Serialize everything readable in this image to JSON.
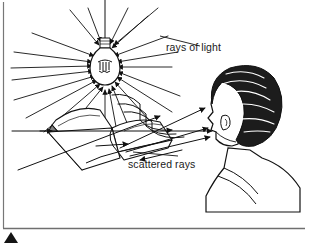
{
  "figure": {
    "kind": "optics-diagram",
    "background_color": "#ffffff",
    "ink_color": "#111111",
    "frame": {
      "left_rule": true,
      "bottom_rule": true,
      "rule_color": "#6f6f6f"
    },
    "page_marker": {
      "name": "corner-triangle-marker",
      "shape": "triangle",
      "color": "#111111"
    }
  },
  "labels": {
    "rays_of_light": "rays of light",
    "scattered_rays": "scattered rays"
  },
  "objects": {
    "lamp": {
      "name": "light-bulb",
      "description": "hanging incandescent bulb with filament and screw base"
    },
    "book": {
      "name": "open-book",
      "description": "open book lying on a surface, drawn in perspective"
    },
    "observer": {
      "name": "observer-head",
      "description": "side-rear view of a person's head with dark hair looking toward the book"
    }
  },
  "rays": {
    "source_rays_label": "rays of light",
    "scattered_rays_label": "scattered rays",
    "arrowhead_direction_source": "toward-bulb",
    "arrowhead_direction_scattered": "toward-eye"
  }
}
